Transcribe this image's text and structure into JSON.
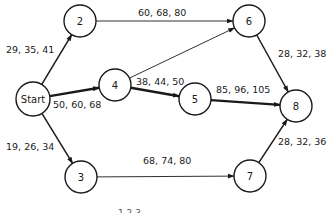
{
  "diagram": {
    "type": "activity-network",
    "nodes": [
      {
        "id": "start",
        "label": "Start"
      },
      {
        "id": "2",
        "label": "2"
      },
      {
        "id": "3",
        "label": "3"
      },
      {
        "id": "4",
        "label": "4"
      },
      {
        "id": "5",
        "label": "5"
      },
      {
        "id": "6",
        "label": "6"
      },
      {
        "id": "7",
        "label": "7"
      },
      {
        "id": "8",
        "label": "8"
      }
    ],
    "edges": [
      {
        "from": "start",
        "to": "2",
        "label": "29, 35, 41",
        "weight": "medium"
      },
      {
        "from": "start",
        "to": "4",
        "label": "50, 60, 68",
        "weight": "critical"
      },
      {
        "from": "start",
        "to": "3",
        "label": "19, 26, 34",
        "weight": "medium"
      },
      {
        "from": "2",
        "to": "6",
        "label": "60, 68, 80",
        "weight": "thin"
      },
      {
        "from": "4",
        "to": "6",
        "label": "",
        "weight": "thin"
      },
      {
        "from": "4",
        "to": "5",
        "label": "38, 44, 50",
        "weight": "critical"
      },
      {
        "from": "5",
        "to": "8",
        "label": "85, 96, 105",
        "weight": "critical"
      },
      {
        "from": "6",
        "to": "8",
        "label": "28, 32, 38",
        "weight": "medium"
      },
      {
        "from": "3",
        "to": "7",
        "label": "68, 74, 80",
        "weight": "thin"
      },
      {
        "from": "7",
        "to": "8",
        "label": "28, 32, 36",
        "weight": "medium"
      }
    ],
    "caption": "1 2 3"
  }
}
